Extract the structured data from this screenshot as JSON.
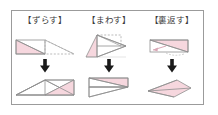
{
  "figure": {
    "title_visible": false,
    "background_color": "#ffffff",
    "frame_color": "#9b9b9b",
    "shape_fill_color": "#f6d7de",
    "shape_stroke_color": "#8f8f8f",
    "dashed_stroke_color": "#a9a9a9",
    "arrow_color": "#1a1a1a",
    "columns": [
      {
        "id": "slide",
        "label": "【ずらす】",
        "label_reading": "zurasu",
        "arrow_glyph": "↓",
        "arrow_name": "down-arrow-icon",
        "top_figure_name": "rectangle-with-pink-triangle-and-dashed-slid-triangle",
        "bottom_figure_name": "parallelogram-with-pink-triangle-on-right"
      },
      {
        "id": "rotate",
        "label": "【まわす】",
        "label_reading": "mawasu",
        "arrow_glyph": "↓",
        "arrow_name": "down-arrow-icon",
        "top_figure_name": "pink-triangle-rotating-into-dashed-outline",
        "bottom_figure_name": "rectangle-with-pink-triangle-top-and-white-triangle-bottom"
      },
      {
        "id": "flip",
        "label": "【裏返す】",
        "label_reading": "uragaesu",
        "arrow_glyph": "↓",
        "arrow_name": "down-arrow-icon",
        "top_figure_name": "rectangle-with-pink-triangle-and-flip-arrow",
        "bottom_figure_name": "flipped-pink-kite-triangle"
      }
    ]
  }
}
